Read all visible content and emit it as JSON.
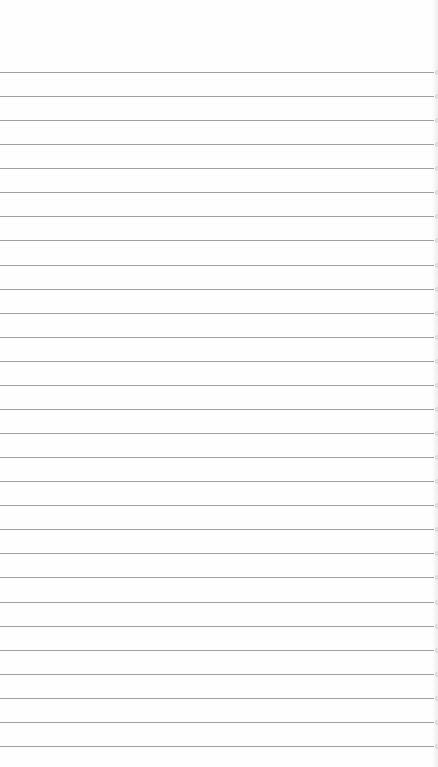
{
  "image": {
    "subject": "blank lined notebook paper",
    "width": 438,
    "height": 767,
    "background_color": "#fefefe",
    "line_color": "#8f8f8f",
    "first_line_y": 72,
    "line_spacing": 24.07,
    "line_count": 29
  }
}
